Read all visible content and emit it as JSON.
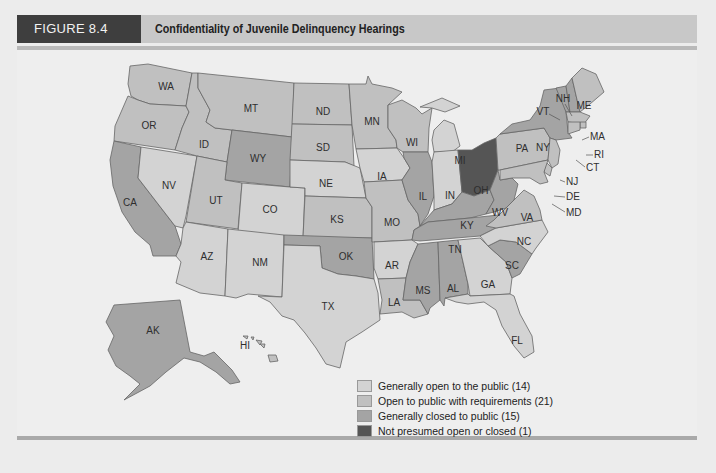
{
  "figure": {
    "number": "FIGURE 8.4",
    "title": "Confidentiality of Juvenile Delinquency Hearings"
  },
  "categories": {
    "open": {
      "label": "Generally open to the public (14)",
      "color": "#d3d3d3",
      "count": 14
    },
    "open_req": {
      "label": "Open to public with requirements (21)",
      "color": "#c0c0c0",
      "count": 21
    },
    "closed": {
      "label": "Generally closed to public (15)",
      "color": "#a4a4a4",
      "count": 15
    },
    "not_presumed": {
      "label": "Not presumed open or closed (1)",
      "color": "#555555",
      "count": 1
    }
  },
  "legend": [
    {
      "key": "open",
      "label": "Generally open to the public (14)",
      "color": "#d3d3d3"
    },
    {
      "key": "open_req",
      "label": "Open to public with requirements (21)",
      "color": "#c0c0c0"
    },
    {
      "key": "closed",
      "label": "Generally closed to public (15)",
      "color": "#a4a4a4"
    },
    {
      "key": "not_presumed",
      "label": "Not presumed open or closed (1)",
      "color": "#555555"
    }
  ],
  "states": {
    "WA": "WA",
    "OR": "OR",
    "CA": "CA",
    "NV": "NV",
    "ID": "ID",
    "MT": "MT",
    "WY": "WY",
    "UT": "UT",
    "CO": "CO",
    "AZ": "AZ",
    "NM": "NM",
    "ND": "ND",
    "SD": "SD",
    "NE": "NE",
    "KS": "KS",
    "OK": "OK",
    "TX": "TX",
    "MN": "MN",
    "IA": "IA",
    "MO": "MO",
    "AR": "AR",
    "LA": "LA",
    "WI": "WI",
    "IL": "IL",
    "MI": "MI",
    "IN": "IN",
    "OH": "OH",
    "KY": "KY",
    "TN": "TN",
    "MS": "MS",
    "AL": "AL",
    "GA": "GA",
    "FL": "FL",
    "SC": "SC",
    "NC": "NC",
    "VA": "VA",
    "WV": "WV",
    "PA": "PA",
    "NY": "NY",
    "VT": "VT",
    "NH": "NH",
    "ME": "ME",
    "MA": "MA",
    "RI": "RI",
    "CT": "CT",
    "NJ": "NJ",
    "DE": "DE",
    "MD": "MD",
    "AK": "AK",
    "HI": "HI"
  }
}
